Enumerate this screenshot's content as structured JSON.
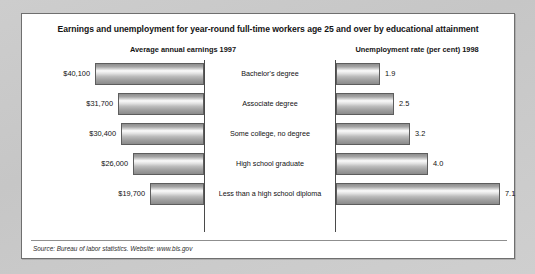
{
  "panel": {
    "title": "Earnings and unemployment for year-round full-time workers age 25 and over by educational attainment",
    "left_subtitle": "Average annual earnings 1997",
    "right_subtitle": "Unemployment rate (per cent) 1998",
    "source": "Source: Bureau of labor statistics. Website: www.bls.gov"
  },
  "colors": {
    "page_background": "#c9c9c9",
    "panel_background": "#ffffff",
    "panel_border": "#6f6f6f",
    "bar_border": "#5d5d5d",
    "bar_dark": "#8a8a8a",
    "bar_highlight": "#fbfbfb",
    "axis": "#4a4a4a",
    "text": "#111111"
  },
  "chart_data": {
    "type": "bar",
    "title": "Earnings and unemployment for year-round full-time workers age 25 and over by educational attainment",
    "orientation": "horizontal",
    "layout": "back-to-back paired bars with centered category labels",
    "categories": [
      "Bachelor's degree",
      "Associate degree",
      "Some college, no degree",
      "High school graduate",
      "Less than a high school diploma"
    ],
    "series": [
      {
        "name": "Average annual earnings 1997",
        "side": "left",
        "direction": "right-to-left",
        "unit": "USD",
        "values": [
          40100,
          31700,
          30400,
          26000,
          19700
        ],
        "labels": [
          "$40,100",
          "$31,700",
          "$30,400",
          "$26,000",
          "$19,700"
        ],
        "axis_max": 44000
      },
      {
        "name": "Unemployment rate (per cent) 1998",
        "side": "right",
        "direction": "left-to-right",
        "unit": "per cent",
        "values": [
          1.9,
          2.5,
          3.2,
          4.0,
          7.1
        ],
        "labels": [
          "1.9",
          "2.5",
          "3.2",
          "4.0",
          "7.1"
        ],
        "axis_max": 7.8
      }
    ],
    "xlabel": "",
    "ylabel": "",
    "grid": false,
    "legend": "none",
    "annotations": [
      "Source: Bureau of labor statistics. Website: www.bls.gov"
    ]
  }
}
